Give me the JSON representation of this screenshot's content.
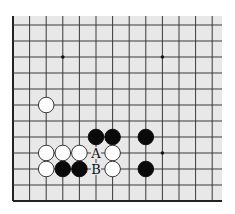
{
  "board": {
    "background": "#e8e8e8",
    "line_color": "#3a3a3a",
    "edge_color": "#222222",
    "origin_x": 13,
    "origin_y": 25,
    "spacing_x": 16.6,
    "spacing_y": 16.0,
    "cols": 13,
    "rows": 12,
    "left_edge": true,
    "bottom_edge": true,
    "stone_radius": 7.8
  },
  "star_points": [
    {
      "col": 3,
      "row": 2
    },
    {
      "col": 9,
      "row": 2
    },
    {
      "col": 9,
      "row": 8
    }
  ],
  "stones": [
    {
      "color": "white",
      "col": 2,
      "row": 5
    },
    {
      "color": "black",
      "col": 5,
      "row": 7
    },
    {
      "color": "black",
      "col": 6,
      "row": 7
    },
    {
      "color": "black",
      "col": 8,
      "row": 7
    },
    {
      "color": "white",
      "col": 2,
      "row": 8
    },
    {
      "color": "white",
      "col": 3,
      "row": 8
    },
    {
      "color": "white",
      "col": 4,
      "row": 8
    },
    {
      "color": "white",
      "col": 6,
      "row": 8
    },
    {
      "color": "white",
      "col": 2,
      "row": 9
    },
    {
      "color": "black",
      "col": 3,
      "row": 9
    },
    {
      "color": "black",
      "col": 4,
      "row": 9
    },
    {
      "color": "white",
      "col": 6,
      "row": 9
    },
    {
      "color": "black",
      "col": 8,
      "row": 9
    }
  ],
  "labels": [
    {
      "text": "A",
      "col": 5,
      "row": 8
    },
    {
      "text": "B",
      "col": 5,
      "row": 9
    }
  ]
}
